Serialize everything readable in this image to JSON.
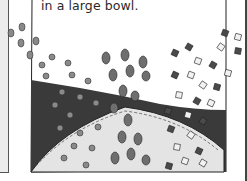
{
  "caption": {
    "text": "in a large bowl."
  },
  "illustration": {
    "subject": "bowl with beans, seeds and cubes",
    "colors": {
      "bowl_dark": "#3a3a3a",
      "bowl_light": "#e4e4e4",
      "bean": "#6e6e6e",
      "cube_dark": "#4a4a4a",
      "cube_light": "#f2f2f2",
      "border": "#222222"
    }
  }
}
